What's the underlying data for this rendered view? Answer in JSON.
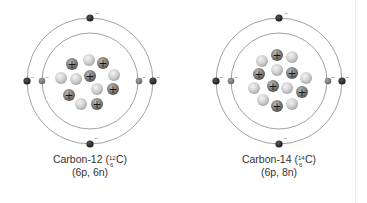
{
  "atoms": [
    {
      "name": "Carbon-12",
      "symbol": "C",
      "mass_number": "12",
      "atomic_number": "6",
      "label": "Carbon-12 (",
      "label_end": "C)",
      "composition": "(6p, 6n)",
      "protons": 6,
      "neutrons": 6,
      "electrons": 6,
      "electron_charge": "−"
    },
    {
      "name": "Carbon-14",
      "symbol": "C",
      "mass_number": "14",
      "atomic_number": "6",
      "label": "Carbon-14 (",
      "label_end": "C)",
      "composition": "(6p, 8n)",
      "protons": 6,
      "neutrons": 8,
      "electrons": 6,
      "electron_charge": "−"
    }
  ],
  "legend": {
    "proton_symbol": "+",
    "electron_symbol": "−"
  },
  "colors": {
    "orbit": "#8a8a8a",
    "proton": "#7a7a7a",
    "neutron": "#cfcfcf",
    "outer_electron": "#2e2e2e",
    "inner_electron": "#7c7c7c",
    "text": "#333333"
  }
}
